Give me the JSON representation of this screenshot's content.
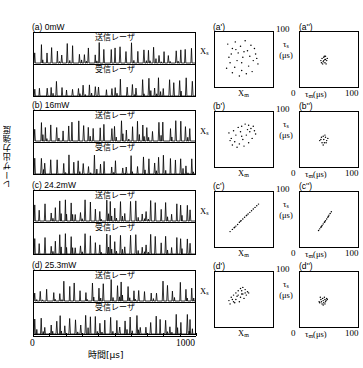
{
  "figure": {
    "ylabel": "レーザ出力強度",
    "xlabel": "時間[μs]",
    "x_min_label": "0",
    "x_max_label": "1000"
  },
  "waveform_labels": {
    "master": "送信レーザ",
    "slave": "受信レーザ"
  },
  "rows": [
    {
      "id": "a",
      "panel_label": "(a) 0mW",
      "power_mw": 0,
      "scatter_label": "(a')",
      "scatter2_label": "(a'')"
    },
    {
      "id": "b",
      "panel_label": "(b) 16mW",
      "power_mw": 16,
      "scatter_label": "(b')",
      "scatter2_label": "(b'')"
    },
    {
      "id": "c",
      "panel_label": "(c) 24.2mW",
      "power_mw": 24.2,
      "scatter_label": "(c')",
      "scatter2_label": "(c'')"
    },
    {
      "id": "d",
      "panel_label": "(d) 25.3mW",
      "power_mw": 25.3,
      "scatter_label": "(d')",
      "scatter2_label": "(d'')"
    }
  ],
  "scatter_axes": {
    "xlabel_left": "X",
    "xlabel_left_sub": "m",
    "ylabel_left": "X",
    "ylabel_left_sub": "s",
    "xlabel_right": "τ",
    "xlabel_right_sub": "m",
    "xlabel_right_unit": "(μs)",
    "ylabel_right": "τ",
    "ylabel_right_sub": "s",
    "ylabel_right_unit": "(μs)",
    "right_min": "0",
    "right_max": "100",
    "left_max": "100"
  },
  "chart_data": {
    "type": "scatter",
    "xlabel": "時間[μs]",
    "ylabel": "レーザ出力強度",
    "xlim": [
      0,
      1000
    ],
    "panels": [
      {
        "panel": "(a) 0mW",
        "type": "timeseries",
        "series": [
          {
            "name": "送信レーザ",
            "description": "chaotic spike train, irregular amplitudes"
          },
          {
            "name": "受信レーザ",
            "description": "chaotic spike train, uncorrelated with master"
          }
        ]
      },
      {
        "panel": "(a')",
        "type": "scatter",
        "xlabel": "X_m",
        "ylabel": "X_s",
        "description": "uncorrelated cloud, no synchronization",
        "points": [
          [
            22,
            78
          ],
          [
            30,
            70
          ],
          [
            35,
            82
          ],
          [
            28,
            60
          ],
          [
            44,
            74
          ],
          [
            52,
            84
          ],
          [
            56,
            66
          ],
          [
            62,
            76
          ],
          [
            48,
            54
          ],
          [
            38,
            48
          ],
          [
            26,
            44
          ],
          [
            34,
            36
          ],
          [
            46,
            30
          ],
          [
            58,
            38
          ],
          [
            66,
            48
          ],
          [
            70,
            60
          ],
          [
            74,
            42
          ],
          [
            64,
            28
          ],
          [
            54,
            24
          ],
          [
            42,
            20
          ],
          [
            30,
            26
          ],
          [
            20,
            34
          ],
          [
            50,
            64
          ],
          [
            60,
            56
          ],
          [
            40,
            62
          ],
          [
            68,
            70
          ],
          [
            24,
            54
          ],
          [
            36,
            68
          ],
          [
            72,
            52
          ],
          [
            46,
            44
          ]
        ]
      },
      {
        "panel": "(a'')",
        "type": "scatter",
        "xlabel": "τ_m (μs)",
        "ylabel": "τ_s (μs)",
        "xlim": [
          0,
          100
        ],
        "ylim": [
          0,
          100
        ],
        "description": "tight unstructured cluster near centre",
        "points": [
          [
            38,
            52
          ],
          [
            41,
            54
          ],
          [
            44,
            50
          ],
          [
            40,
            46
          ],
          [
            43,
            44
          ],
          [
            46,
            48
          ],
          [
            36,
            48
          ],
          [
            42,
            56
          ],
          [
            45,
            42
          ],
          [
            39,
            42
          ],
          [
            47,
            52
          ],
          [
            37,
            44
          ],
          [
            44,
            56
          ],
          [
            41,
            48
          ],
          [
            43,
            50
          ]
        ]
      },
      {
        "panel": "(b) 16mW",
        "type": "timeseries",
        "series": [
          {
            "name": "送信レーザ",
            "description": "chaotic spike train"
          },
          {
            "name": "受信レーザ",
            "description": "chaotic spike train, weak correlation"
          }
        ]
      },
      {
        "panel": "(b')",
        "type": "scatter",
        "xlabel": "X_m",
        "ylabel": "X_s",
        "description": "diffuse cloud, partial correlation",
        "points": [
          [
            24,
            62
          ],
          [
            32,
            66
          ],
          [
            40,
            72
          ],
          [
            46,
            74
          ],
          [
            52,
            78
          ],
          [
            58,
            76
          ],
          [
            62,
            70
          ],
          [
            66,
            74
          ],
          [
            56,
            68
          ],
          [
            44,
            64
          ],
          [
            36,
            58
          ],
          [
            28,
            52
          ],
          [
            34,
            46
          ],
          [
            42,
            42
          ],
          [
            50,
            38
          ],
          [
            58,
            44
          ],
          [
            64,
            52
          ],
          [
            70,
            60
          ],
          [
            48,
            50
          ],
          [
            38,
            36
          ],
          [
            30,
            40
          ],
          [
            54,
            58
          ],
          [
            60,
            64
          ],
          [
            68,
            66
          ],
          [
            26,
            48
          ],
          [
            46,
            56
          ]
        ]
      },
      {
        "panel": "(b'')",
        "type": "scatter",
        "xlabel": "τ_m (μs)",
        "ylabel": "τ_s (μs)",
        "xlim": [
          0,
          100
        ],
        "ylim": [
          0,
          100
        ],
        "description": "small loose cluster",
        "points": [
          [
            36,
            50
          ],
          [
            40,
            56
          ],
          [
            44,
            54
          ],
          [
            46,
            48
          ],
          [
            42,
            44
          ],
          [
            38,
            44
          ],
          [
            34,
            48
          ],
          [
            43,
            58
          ],
          [
            48,
            52
          ],
          [
            40,
            40
          ],
          [
            45,
            44
          ],
          [
            37,
            54
          ],
          [
            41,
            50
          ]
        ]
      },
      {
        "panel": "(c) 24.2mW",
        "type": "timeseries",
        "series": [
          {
            "name": "送信レーザ",
            "description": "chaotic spike train"
          },
          {
            "name": "受信レーザ",
            "description": "synchronized replica of master"
          }
        ]
      },
      {
        "panel": "(c')",
        "type": "scatter",
        "xlabel": "X_m",
        "ylabel": "X_s",
        "description": "tight diagonal line — high-quality synchronization",
        "points": [
          [
            26,
            28
          ],
          [
            30,
            32
          ],
          [
            33,
            35
          ],
          [
            36,
            38
          ],
          [
            39,
            41
          ],
          [
            42,
            45
          ],
          [
            45,
            48
          ],
          [
            48,
            51
          ],
          [
            51,
            54
          ],
          [
            54,
            57
          ],
          [
            57,
            60
          ],
          [
            60,
            63
          ],
          [
            63,
            66
          ],
          [
            66,
            69
          ],
          [
            69,
            72
          ],
          [
            72,
            75
          ],
          [
            75,
            78
          ],
          [
            34,
            36
          ],
          [
            44,
            47
          ],
          [
            55,
            58
          ]
        ]
      },
      {
        "panel": "(c'')",
        "type": "scatter",
        "xlabel": "τ_m (μs)",
        "ylabel": "τ_s (μs)",
        "xlim": [
          0,
          100
        ],
        "ylim": [
          0,
          100
        ],
        "description": "narrow diagonal streak",
        "points": [
          [
            32,
            30
          ],
          [
            34,
            33
          ],
          [
            36,
            36
          ],
          [
            38,
            39
          ],
          [
            40,
            42
          ],
          [
            42,
            45
          ],
          [
            44,
            48
          ],
          [
            46,
            51
          ],
          [
            48,
            54
          ],
          [
            50,
            58
          ],
          [
            52,
            61
          ],
          [
            54,
            64
          ],
          [
            37,
            37
          ],
          [
            43,
            46
          ],
          [
            49,
            56
          ]
        ]
      },
      {
        "panel": "(d) 25.3mW",
        "type": "timeseries",
        "series": [
          {
            "name": "送信レーザ",
            "description": "chaotic spike train"
          },
          {
            "name": "受信レーザ",
            "description": "partially synchronized spike train"
          }
        ]
      },
      {
        "panel": "(d')",
        "type": "scatter",
        "xlabel": "X_m",
        "ylabel": "X_s",
        "description": "elongated diagonal cloud — degraded synchronization",
        "points": [
          [
            24,
            48
          ],
          [
            28,
            54
          ],
          [
            32,
            58
          ],
          [
            36,
            62
          ],
          [
            40,
            66
          ],
          [
            44,
            70
          ],
          [
            48,
            72
          ],
          [
            52,
            68
          ],
          [
            56,
            64
          ],
          [
            46,
            60
          ],
          [
            38,
            56
          ],
          [
            30,
            50
          ],
          [
            34,
            44
          ],
          [
            42,
            46
          ],
          [
            50,
            52
          ],
          [
            54,
            58
          ],
          [
            58,
            62
          ],
          [
            26,
            42
          ],
          [
            44,
            54
          ],
          [
            36,
            50
          ],
          [
            48,
            60
          ],
          [
            40,
            58
          ],
          [
            32,
            46
          ],
          [
            52,
            62
          ],
          [
            46,
            66
          ]
        ]
      },
      {
        "panel": "(d'')",
        "type": "scatter",
        "xlabel": "τ_m (μs)",
        "ylabel": "τ_s (μs)",
        "xlim": [
          0,
          100
        ],
        "ylim": [
          0,
          100
        ],
        "description": "dense cluster with small diagonal tendency",
        "points": [
          [
            34,
            44
          ],
          [
            37,
            46
          ],
          [
            40,
            48
          ],
          [
            43,
            50
          ],
          [
            46,
            52
          ],
          [
            38,
            42
          ],
          [
            41,
            44
          ],
          [
            44,
            46
          ],
          [
            36,
            50
          ],
          [
            39,
            52
          ],
          [
            42,
            54
          ],
          [
            45,
            48
          ],
          [
            33,
            46
          ],
          [
            47,
            50
          ],
          [
            40,
            40
          ],
          [
            43,
            42
          ],
          [
            35,
            54
          ]
        ]
      }
    ]
  }
}
